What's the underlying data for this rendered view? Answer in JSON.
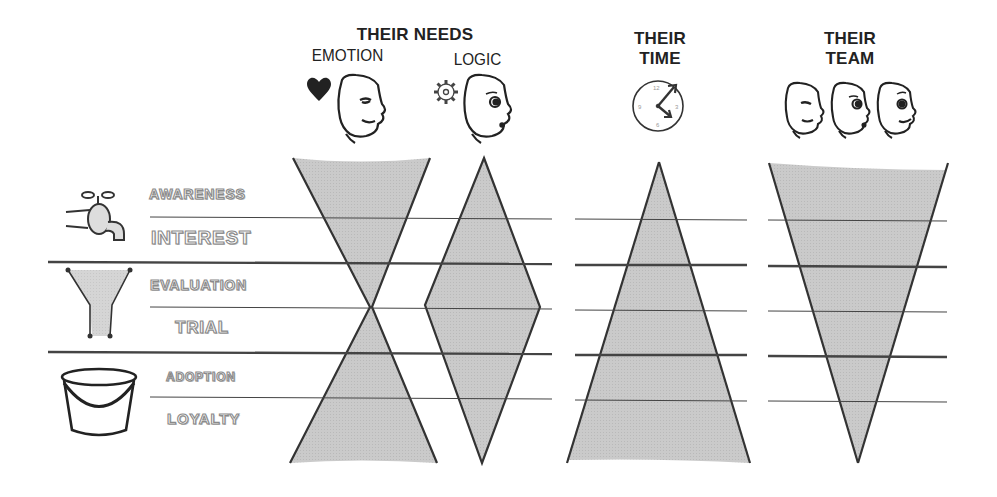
{
  "headers": {
    "needs": {
      "title": "THEIR NEEDS",
      "emotion_label": "EMOTION",
      "logic_label": "LOGIC"
    },
    "time": {
      "line1": "THEIR",
      "line2": "TIME"
    },
    "team": {
      "line1": "THEIR",
      "line2": "TEAM"
    }
  },
  "stages": [
    {
      "label": "AWARENESS",
      "group": "tap"
    },
    {
      "label": "INTEREST",
      "group": "tap"
    },
    {
      "label": "EVALUATION",
      "group": "funnel"
    },
    {
      "label": "TRIAL",
      "group": "funnel"
    },
    {
      "label": "ADOPTION",
      "group": "bucket"
    },
    {
      "label": "LOYALTY",
      "group": "bucket"
    }
  ],
  "icons": {
    "stage_groups": [
      "tap-icon",
      "funnel-icon",
      "bucket-icon"
    ],
    "headers": [
      "heart-icon",
      "face-emotion-icon",
      "gear-icon",
      "face-logic-icon",
      "clock-icon",
      "team-faces-icon"
    ]
  },
  "shapes": [
    {
      "column": "emotion",
      "shape": "hourglass"
    },
    {
      "column": "logic",
      "shape": "diamond"
    },
    {
      "column": "time",
      "shape": "triangle-up"
    },
    {
      "column": "team",
      "shape": "triangle-down"
    }
  ],
  "colors": {
    "fill": "#c8c8c8",
    "outline": "#333333",
    "line": "#444444"
  }
}
